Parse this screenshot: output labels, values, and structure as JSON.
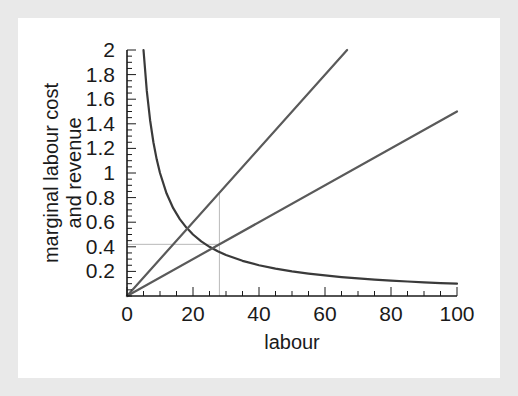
{
  "figure": {
    "background_color": "#e9e9e9",
    "plot_background_color": "#ffffff"
  },
  "chart_data": {
    "type": "line",
    "title": "",
    "subtitle": "",
    "xlabel": "labour",
    "ylabel": "marginal labour cost and revenue",
    "ylabel_line1": "marginal labour cost",
    "ylabel_line2": "and revenue",
    "xlim": [
      0,
      100
    ],
    "ylim": [
      0,
      2
    ],
    "xticks": [
      0,
      20,
      40,
      60,
      80,
      100
    ],
    "xtick_labels": [
      "0",
      "20",
      "40",
      "60",
      "80",
      "100"
    ],
    "x_minor_tick_step": 5,
    "yticks": [
      0.2,
      0.4,
      0.6,
      0.8,
      1,
      1.2,
      1.4,
      1.6,
      1.8,
      2
    ],
    "ytick_labels": [
      "0.2",
      "0.4",
      "0.6",
      "0.8",
      "1",
      "1.2",
      "1.4",
      "1.6",
      "1.8",
      "2"
    ],
    "y_minor_tick_step": 0.05,
    "grid": false,
    "legend": null,
    "axis_color": "#1a1a1a",
    "series": [
      {
        "name": "marginal revenue product (downward sloping)",
        "color": "#3a3a3a",
        "width": 2.2,
        "formula": "y = 10 / x",
        "x": [
          5,
          6,
          7,
          8,
          9,
          10,
          12,
          14,
          16,
          18,
          20,
          22.5,
          25,
          27.5,
          30,
          35,
          40,
          45,
          50,
          55,
          60,
          65,
          70,
          75,
          80,
          85,
          90,
          95,
          100
        ],
        "y": [
          2,
          1.667,
          1.429,
          1.25,
          1.111,
          1,
          0.833,
          0.714,
          0.625,
          0.556,
          0.5,
          0.444,
          0.4,
          0.364,
          0.333,
          0.286,
          0.25,
          0.222,
          0.2,
          0.182,
          0.167,
          0.154,
          0.143,
          0.133,
          0.125,
          0.118,
          0.111,
          0.105,
          0.1
        ]
      },
      {
        "name": "marginal labour cost (steep line)",
        "color": "#5a5a5a",
        "width": 2.2,
        "formula": "y = 0.03 x",
        "x": [
          0,
          66.7
        ],
        "y": [
          0,
          2
        ]
      },
      {
        "name": "labour supply / wage (shallow line)",
        "color": "#5a5a5a",
        "width": 2.2,
        "formula": "y = 0.015 x",
        "x": [
          0,
          100
        ],
        "y": [
          0,
          1.5
        ]
      }
    ],
    "annotations": [
      {
        "name": "equilibrium-guide-lines",
        "color": "#b9b9b9",
        "width": 1,
        "x": 28,
        "y_intersection": 0.84,
        "y_wage": 0.42,
        "description": "grey vertical line at labour = 28 from axis up to the marginal labour cost intersection, and grey horizontal line at 0.42 to the wage line"
      }
    ]
  }
}
